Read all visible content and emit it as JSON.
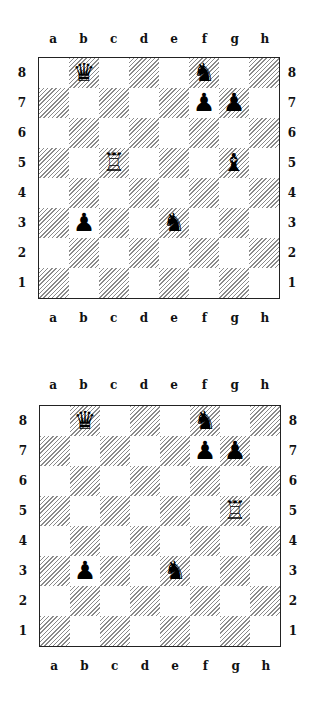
{
  "files": [
    "a",
    "b",
    "c",
    "d",
    "e",
    "f",
    "g",
    "h"
  ],
  "ranks": [
    "8",
    "7",
    "6",
    "5",
    "4",
    "3",
    "2",
    "1"
  ],
  "glyphs": {
    "bq": "♛",
    "bn": "♞",
    "bp": "♟",
    "bb": "♝",
    "wr": "♖"
  },
  "diagrams": [
    {
      "name": "diagram-1",
      "pieces": [
        {
          "square": "b8",
          "piece": "bq",
          "name": "black-queen"
        },
        {
          "square": "f8",
          "piece": "bn",
          "name": "black-knight"
        },
        {
          "square": "f7",
          "piece": "bp",
          "name": "black-pawn"
        },
        {
          "square": "g7",
          "piece": "bp",
          "name": "black-pawn"
        },
        {
          "square": "c5",
          "piece": "wr",
          "name": "white-rook"
        },
        {
          "square": "g5",
          "piece": "bb",
          "name": "black-bishop"
        },
        {
          "square": "b3",
          "piece": "bp",
          "name": "black-pawn"
        },
        {
          "square": "e3",
          "piece": "bn",
          "name": "black-knight"
        }
      ]
    },
    {
      "name": "diagram-2",
      "pieces": [
        {
          "square": "b8",
          "piece": "bq",
          "name": "black-queen"
        },
        {
          "square": "f8",
          "piece": "bn",
          "name": "black-knight"
        },
        {
          "square": "f7",
          "piece": "bp",
          "name": "black-pawn"
        },
        {
          "square": "g7",
          "piece": "bp",
          "name": "black-pawn"
        },
        {
          "square": "g5",
          "piece": "wr",
          "name": "white-rook"
        },
        {
          "square": "b3",
          "piece": "bp",
          "name": "black-pawn"
        },
        {
          "square": "e3",
          "piece": "bn",
          "name": "black-knight"
        }
      ]
    }
  ]
}
